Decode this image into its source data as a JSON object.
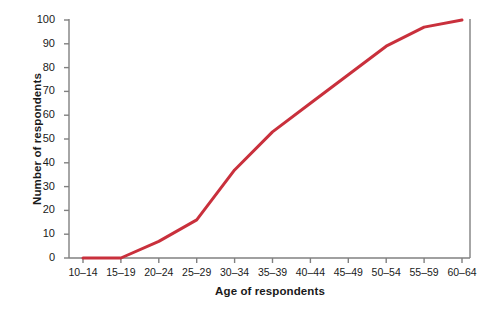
{
  "chart_data": {
    "type": "line",
    "title": "",
    "subtitle": "",
    "xlabel": "Age of respondents",
    "ylabel": "Number of respondents",
    "categories": [
      "10–14",
      "15–19",
      "20–24",
      "25–29",
      "30–34",
      "35–39",
      "40–44",
      "45–49",
      "50–54",
      "55–59",
      "60–64"
    ],
    "values": [
      0,
      0,
      7,
      16,
      37,
      53,
      65,
      77,
      89,
      97,
      100
    ],
    "series": [
      {
        "name": "Cumulative respondents",
        "color": "#C9303C",
        "values": [
          0,
          0,
          7,
          16,
          37,
          53,
          65,
          77,
          89,
          97,
          100
        ]
      }
    ],
    "ylim": [
      0,
      100
    ],
    "yticks": [
      0,
      10,
      20,
      30,
      40,
      50,
      60,
      70,
      80,
      90,
      100
    ],
    "ytick_labels": [
      "0",
      "10",
      "20",
      "30",
      "40",
      "50",
      "60",
      "70",
      "80",
      "90",
      "100"
    ],
    "grid": false,
    "legend": false,
    "legend_position": "none",
    "axis_color": "#808080",
    "background": "#ffffff",
    "line_width": 3
  }
}
